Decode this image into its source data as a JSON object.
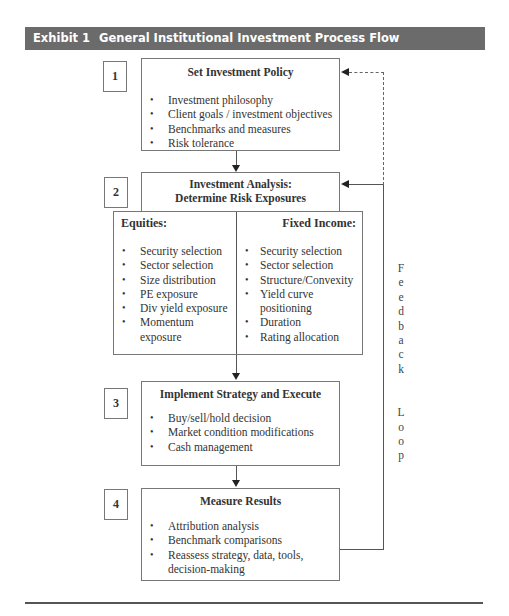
{
  "header": {
    "exhibit_label": "Exhibit 1",
    "title": "General Institutional Investment Process Flow",
    "bar_color": "#6b6b6b"
  },
  "steps": [
    {
      "number": "1",
      "title": "Set Investment Policy",
      "items": [
        "Investment philosophy",
        "Client goals / investment objectives",
        "Benchmarks and measures",
        "Risk tolerance"
      ]
    },
    {
      "number": "2",
      "title_line1": "Investment Analysis:",
      "title_line2": "Determine Risk Exposures",
      "equities": {
        "title": "Equities:",
        "items": [
          "Security selection",
          "Sector selection",
          "Size distribution",
          "PE exposure",
          "Div yield exposure",
          "Momentum exposure"
        ]
      },
      "fixed_income": {
        "title": "Fixed Income:",
        "items": [
          "Security selection",
          "Sector selection",
          "Structure/Convexity",
          "Yield curve positioning",
          "Duration",
          "Rating allocation"
        ]
      }
    },
    {
      "number": "3",
      "title": "Implement Strategy and Execute",
      "items": [
        "Buy/sell/hold decision",
        "Market condition modifications",
        "Cash management"
      ]
    },
    {
      "number": "4",
      "title": "Measure Results",
      "items": [
        "Attribution analysis",
        "Benchmark comparisons",
        "Reassess strategy, data, tools, decision-making"
      ]
    }
  ],
  "feedback_loop": {
    "letters": [
      "F",
      "e",
      "e",
      "d",
      "b",
      "a",
      "c",
      "k",
      "",
      "L",
      "o",
      "o",
      "p"
    ]
  }
}
